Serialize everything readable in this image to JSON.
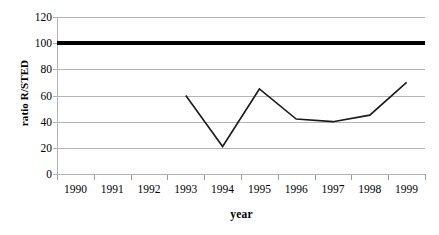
{
  "chart_data": {
    "type": "line",
    "title": "",
    "xlabel": "year",
    "ylabel": "ratio R/STED",
    "categories": [
      "1990",
      "1991",
      "1992",
      "1993",
      "1994",
      "1995",
      "1996",
      "1997",
      "1998",
      "1999"
    ],
    "series": [
      {
        "name": "ratio R/STED",
        "values": [
          null,
          null,
          null,
          60,
          21,
          65,
          42,
          40,
          45,
          70
        ],
        "color": "#1a1a1a",
        "line_width": 1.6
      },
      {
        "name": "reference line",
        "values": [
          100,
          100,
          100,
          100,
          100,
          100,
          100,
          100,
          100,
          100
        ],
        "color": "#000000",
        "line_width": 4
      }
    ],
    "ylim": [
      0,
      120
    ],
    "ytick_values": [
      0,
      20,
      40,
      60,
      80,
      100,
      120
    ],
    "ytick_labels": [
      "0",
      "20",
      "40",
      "60",
      "80",
      "100",
      "120"
    ],
    "grid": true,
    "grid_axis": "y",
    "grid_color": "#b3b3b3",
    "legend": "none",
    "axis_color": "#b3b3b3",
    "background": "#ffffff"
  },
  "axes": {
    "y_title": "ratio R/STED",
    "x_title": "year"
  }
}
